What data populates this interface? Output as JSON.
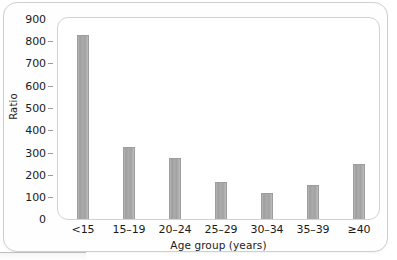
{
  "chart_data": {
    "type": "bar",
    "title": "",
    "subtitle": "",
    "xlabel": "Age group (years)",
    "ylabel": "Ratio",
    "categories": [
      "<15",
      "15–19",
      "20–24",
      "25–29",
      "30–34",
      "35–39",
      "≥40"
    ],
    "values": [
      830,
      325,
      275,
      168,
      118,
      153,
      247
    ],
    "ylim": [
      0,
      900
    ],
    "ytick_labels": [
      "900",
      "800",
      "700",
      "600",
      "500",
      "400",
      "300",
      "200",
      "100",
      "0"
    ],
    "ytick_values": [
      900,
      800,
      700,
      600,
      500,
      400,
      300,
      200,
      100,
      0
    ],
    "ytick_step": 100,
    "grid": false,
    "legend": null,
    "legend_position": "none",
    "annotations": [],
    "bar_color": "#a8a8a8",
    "bar_edge_color": "#9d9d9d",
    "plot_background": "#ffffff",
    "axis_text_color": "#1b1b1b",
    "frame_color": "#cfcfcf"
  }
}
